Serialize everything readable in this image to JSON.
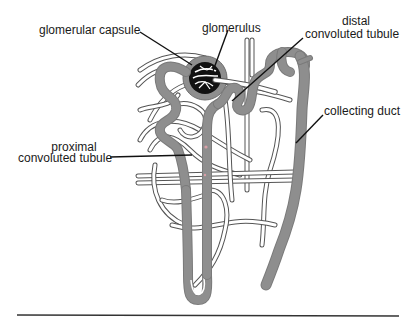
{
  "figure": {
    "labels": {
      "glomerular_capsule": "glomerular capsule",
      "glomerulus": "glomerulus",
      "distal_line1": "distal",
      "distal_line2": "convoluted tubule",
      "collecting_duct": "collecting duct",
      "proximal_line1": "proximal",
      "proximal_line2": "convoluted tubule"
    },
    "colors": {
      "tubule": "#8e8e8e",
      "tubule_outline": "#6e6e6e",
      "glomerulus": "#111111",
      "capillary_outline": "#555555",
      "leader_line": "#111111",
      "baseline": "#333333"
    }
  }
}
